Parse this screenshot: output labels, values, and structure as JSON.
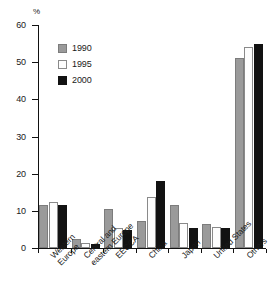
{
  "chart_data": {
    "type": "bar",
    "title": "",
    "xlabel": "",
    "ylabel": "%",
    "ylim": [
      0,
      60
    ],
    "yticks": [
      0,
      10,
      20,
      30,
      40,
      50,
      60
    ],
    "ytick_labels": [
      "0",
      "10",
      "20",
      "30",
      "40",
      "50",
      "60"
    ],
    "grid": false,
    "legend_position": "upper-left-inside",
    "categories": [
      "Western\nEurope",
      "Central and\neastern Europe",
      "EECCA",
      "China",
      "Japan",
      "United States",
      "Others"
    ],
    "series": [
      {
        "name": "1990",
        "color": "#9a9a9a",
        "values": [
          11.5,
          2.4,
          10.5,
          7.4,
          11.5,
          6.5,
          51.0
        ]
      },
      {
        "name": "1995",
        "color": "#ffffff",
        "values": [
          12.3,
          1.4,
          5.3,
          13.8,
          6.7,
          5.6,
          54.0
        ]
      },
      {
        "name": "2000",
        "color": "#121212",
        "values": [
          11.5,
          1.0,
          4.9,
          18.1,
          5.4,
          5.4,
          55.0
        ]
      }
    ]
  },
  "legend": {
    "items": [
      {
        "label": "1990",
        "swatch": "gray-swatch"
      },
      {
        "label": "1995",
        "swatch": "white-swatch"
      },
      {
        "label": "2000",
        "swatch": "black-swatch"
      }
    ]
  },
  "axis": {
    "y_unit": "%"
  }
}
